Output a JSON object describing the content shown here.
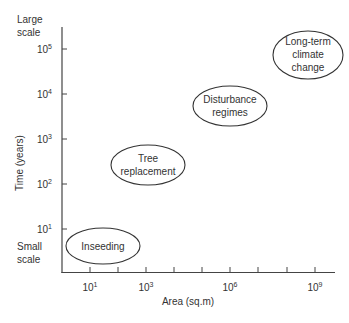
{
  "diagram": {
    "y_axis": {
      "label": "Time (years)",
      "top_label_line1": "Large",
      "top_label_line2": "scale",
      "bottom_label_line1": "Small",
      "bottom_label_line2": "scale",
      "ticks": [
        {
          "base": "10",
          "exp": "5"
        },
        {
          "base": "10",
          "exp": "4"
        },
        {
          "base": "10",
          "exp": "3"
        },
        {
          "base": "10",
          "exp": "2"
        },
        {
          "base": "10",
          "exp": "1"
        }
      ]
    },
    "x_axis": {
      "label": "Area (sq.m)",
      "ticks": [
        {
          "base": "10",
          "exp": "1"
        },
        {
          "base": "10",
          "exp": "3"
        },
        {
          "base": "10",
          "exp": "6"
        },
        {
          "base": "10",
          "exp": "9"
        }
      ]
    },
    "nodes": [
      {
        "id": "inseeding",
        "line1": "Inseeding"
      },
      {
        "id": "tree-replacement",
        "line1": "Tree",
        "line2": "replacement"
      },
      {
        "id": "disturbance-regimes",
        "line1": "Disturbance",
        "line2": "regimes"
      },
      {
        "id": "long-term-climate-change",
        "line1": "Long-term",
        "line2": "climate",
        "line3": "change"
      }
    ]
  }
}
